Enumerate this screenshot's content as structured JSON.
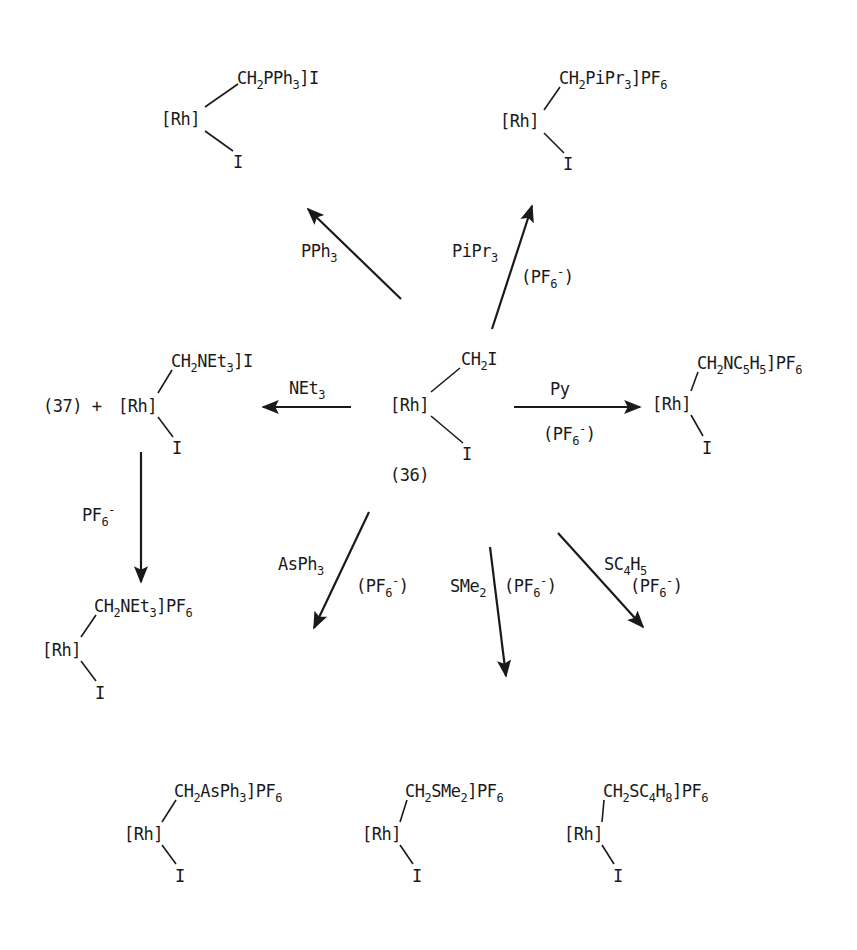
{
  "diagram": {
    "type": "reaction-scheme",
    "center": {
      "id": "(36)",
      "rh": "[Rh]",
      "top": "CH_2I",
      "bottom": "I"
    },
    "products": [
      {
        "name": "pph3-product",
        "rh": "[Rh]",
        "top": "CH_2PPh_3]I",
        "bottom": "I"
      },
      {
        "name": "pipr3-product",
        "rh": "[Rh]",
        "top": "CH_2PiPr_3]PF_6",
        "bottom": "I"
      },
      {
        "name": "net3-product",
        "prefix": "(37) +",
        "rh": "[Rh]",
        "top": "CH_2NEt_3]I",
        "bottom": "I"
      },
      {
        "name": "py-product",
        "rh": "[Rh]",
        "top": "CH_2NC_5H_5]PF_6",
        "bottom": "I"
      },
      {
        "name": "net3-pf6-product",
        "rh": "[Rh]",
        "top": "CH_2NEt_3]PF_6",
        "bottom": "I"
      },
      {
        "name": "asph3-product",
        "rh": "[Rh]",
        "top": "CH_2AsPh_3]PF_6",
        "bottom": "I"
      },
      {
        "name": "sme2-product",
        "rh": "[Rh]",
        "top": "CH_2SMe_2]PF_6",
        "bottom": "I"
      },
      {
        "name": "sc4h8-product",
        "rh": "[Rh]",
        "top": "CH_2SC_4H_8]PF_6",
        "bottom": "I"
      }
    ],
    "reagents": [
      {
        "name": "pph3-reagent",
        "text": "PPh_3"
      },
      {
        "name": "pipr3-reagent",
        "text": "PiPr_3"
      },
      {
        "name": "pipr3-counterion",
        "text": "(PF_6^-)"
      },
      {
        "name": "net3-reagent",
        "text": "NEt_3"
      },
      {
        "name": "py-reagent",
        "text": "Py"
      },
      {
        "name": "py-counterion",
        "text": "(PF_6^-)"
      },
      {
        "name": "pf6-reagent",
        "text": "PF_6^-"
      },
      {
        "name": "asph3-reagent",
        "text": "AsPh_3"
      },
      {
        "name": "asph3-counterion",
        "text": "(PF_6^-)"
      },
      {
        "name": "sme2-reagent",
        "text": "SMe_2"
      },
      {
        "name": "sme2-counterion",
        "text": "(PF_6^-)"
      },
      {
        "name": "sc4h5-reagent",
        "text": "SC_4H_5"
      },
      {
        "name": "sc4h5-counterion",
        "text": "(PF_6^-)"
      }
    ],
    "colors": {
      "ink": "#1a1a1a",
      "background": "#ffffff"
    }
  }
}
